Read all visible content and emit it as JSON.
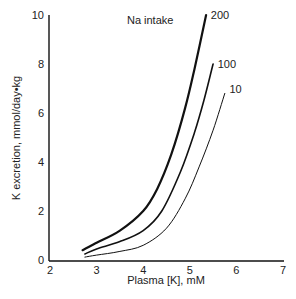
{
  "chart_data": {
    "type": "line",
    "title": "",
    "xlabel": "Plasma [K], mM",
    "ylabel": "K excretion, mmol/day•kg",
    "xlim": [
      2,
      7
    ],
    "ylim": [
      0,
      10
    ],
    "xticks": [
      2,
      3,
      4,
      5,
      6,
      7
    ],
    "yticks": [
      0,
      2,
      4,
      6,
      8,
      10
    ],
    "grid": false,
    "legend_title": "Na intake",
    "series": [
      {
        "name": "200",
        "stroke_width": 2.2,
        "x": [
          2.7,
          3.0,
          3.5,
          4.0,
          4.3,
          4.6,
          4.9,
          5.1,
          5.35
        ],
        "y": [
          0.4,
          0.7,
          1.2,
          2.0,
          2.9,
          4.3,
          6.2,
          7.8,
          10.0
        ]
      },
      {
        "name": "100",
        "stroke_width": 1.6,
        "x": [
          2.75,
          3.0,
          3.5,
          4.0,
          4.4,
          4.8,
          5.1,
          5.3,
          5.5
        ],
        "y": [
          0.25,
          0.45,
          0.75,
          1.2,
          2.0,
          3.6,
          5.2,
          6.5,
          8.0
        ]
      },
      {
        "name": "10",
        "stroke_width": 1.0,
        "x": [
          2.75,
          3.0,
          3.5,
          4.0,
          4.5,
          4.9,
          5.2,
          5.5,
          5.75
        ],
        "y": [
          0.12,
          0.2,
          0.35,
          0.6,
          1.3,
          2.5,
          3.8,
          5.3,
          6.8
        ]
      }
    ],
    "annotations": [
      {
        "text": "Na intake",
        "x": 4.15,
        "y": 9.8
      },
      {
        "text": "200",
        "x": 5.45,
        "y": 10.0
      },
      {
        "text": "100",
        "x": 5.6,
        "y": 8.0
      },
      {
        "text": "10",
        "x": 5.85,
        "y": 7.0
      }
    ]
  },
  "labels": {
    "x_axis": "Plasma [K], mM",
    "y_axis": "K excretion, mmol/day•kg",
    "legend_title": "Na intake"
  }
}
